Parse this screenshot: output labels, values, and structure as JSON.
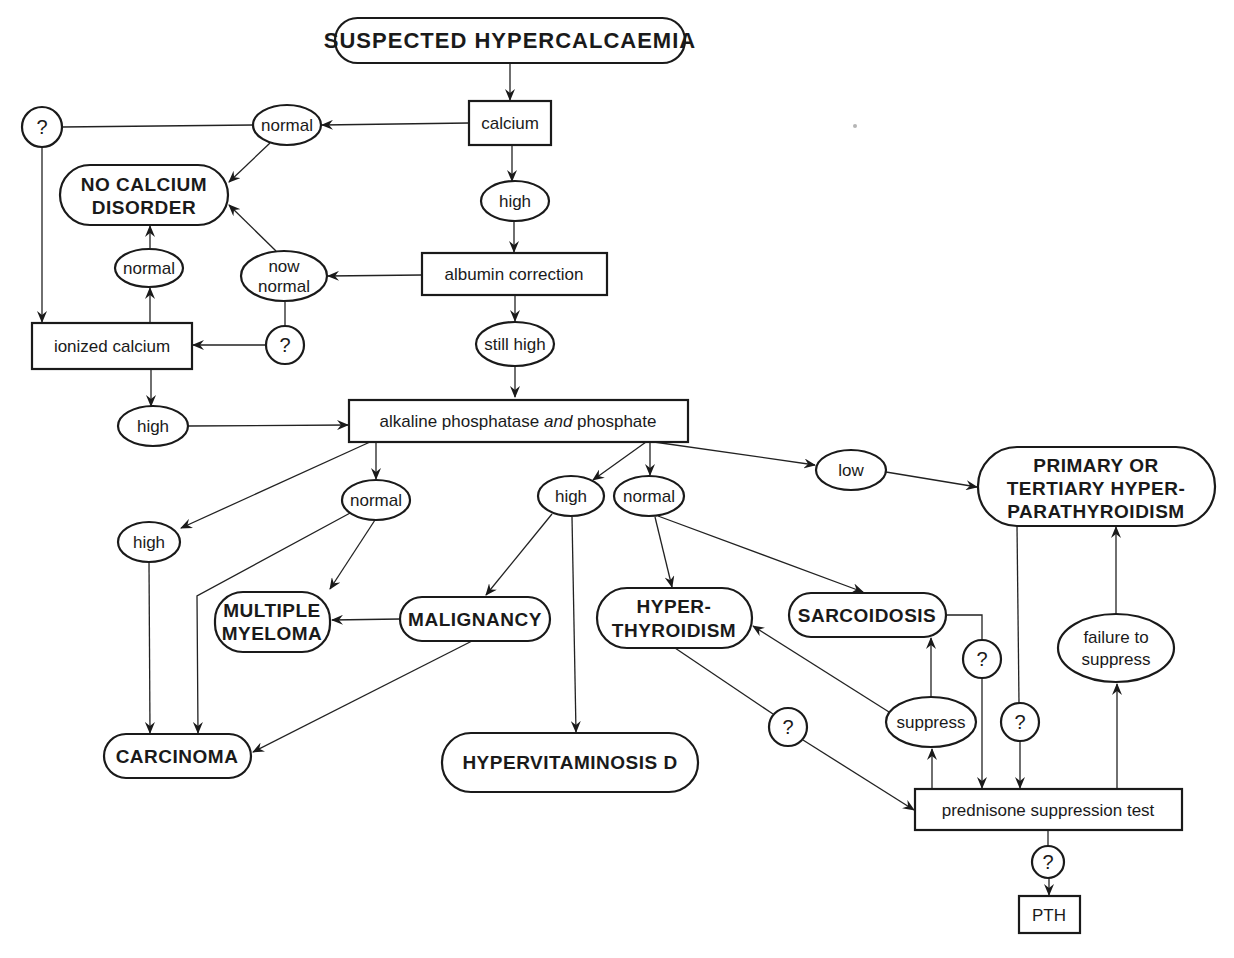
{
  "diagram": {
    "title": "SUSPECTED HYPERCALCAEMIA",
    "nodes": {
      "start": {
        "lines": [
          "SUSPECTED HYPERCALCAEMIA"
        ],
        "shape": "terminal"
      },
      "calcium": {
        "lines": [
          "calcium"
        ],
        "shape": "box"
      },
      "high_calcium": {
        "lines": [
          "high"
        ],
        "shape": "ellipse"
      },
      "normal_calcium": {
        "lines": [
          "normal"
        ],
        "shape": "ellipse"
      },
      "q_top_left": {
        "lines": [
          "?"
        ],
        "shape": "circle"
      },
      "no_calcium_disorder": {
        "lines": [
          "NO CALCIUM",
          "DISORDER"
        ],
        "shape": "terminal"
      },
      "albumin_correction": {
        "lines": [
          "albumin correction"
        ],
        "shape": "box"
      },
      "now_normal": {
        "lines": [
          "now",
          "normal"
        ],
        "shape": "ellipse"
      },
      "q_now_normal": {
        "lines": [
          "?"
        ],
        "shape": "circle"
      },
      "normal_ionized": {
        "lines": [
          "normal"
        ],
        "shape": "ellipse"
      },
      "ionized_calcium": {
        "lines": [
          "ionized calcium"
        ],
        "shape": "box"
      },
      "high_ionized": {
        "lines": [
          "high"
        ],
        "shape": "ellipse"
      },
      "still_high": {
        "lines": [
          "still high"
        ],
        "shape": "ellipse"
      },
      "alk_phos": {
        "lines": [
          "alkaline phosphatase ",
          "and",
          " phosphate"
        ],
        "shape": "box"
      },
      "high_alk_left": {
        "lines": [
          "high"
        ],
        "shape": "ellipse"
      },
      "normal_alk_left": {
        "lines": [
          "normal"
        ],
        "shape": "ellipse"
      },
      "high_phos_mid": {
        "lines": [
          "high"
        ],
        "shape": "ellipse"
      },
      "normal_phos_mid": {
        "lines": [
          "normal"
        ],
        "shape": "ellipse"
      },
      "low_phos": {
        "lines": [
          "low"
        ],
        "shape": "ellipse"
      },
      "primary_hpt": {
        "lines": [
          "PRIMARY OR",
          "TERTIARY HYPER-",
          "PARATHYROIDISM"
        ],
        "shape": "terminal"
      },
      "multiple_myeloma": {
        "lines": [
          "MULTIPLE",
          "MYELOMA"
        ],
        "shape": "terminal"
      },
      "malignancy": {
        "lines": [
          "MALIGNANCY"
        ],
        "shape": "terminal"
      },
      "hyperthyroidism": {
        "lines": [
          "HYPER-",
          "THYROIDISM"
        ],
        "shape": "terminal"
      },
      "sarcoidosis": {
        "lines": [
          "SARCOIDOSIS"
        ],
        "shape": "terminal"
      },
      "carcinoma": {
        "lines": [
          "CARCINOMA"
        ],
        "shape": "terminal"
      },
      "hypervitaminosis_d": {
        "lines": [
          "HYPERVITAMINOSIS D"
        ],
        "shape": "terminal"
      },
      "q_hyperthyroid": {
        "lines": [
          "?"
        ],
        "shape": "circle"
      },
      "suppress": {
        "lines": [
          "suppress"
        ],
        "shape": "ellipse"
      },
      "q_sarcoid": {
        "lines": [
          "?"
        ],
        "shape": "circle"
      },
      "q_primary": {
        "lines": [
          "?"
        ],
        "shape": "circle"
      },
      "failure_to_suppress": {
        "lines": [
          "failure to",
          "suppress"
        ],
        "shape": "ellipse"
      },
      "prednisone_test": {
        "lines": [
          "prednisone suppression test"
        ],
        "shape": "box"
      },
      "q_pth": {
        "lines": [
          "?"
        ],
        "shape": "circle"
      },
      "pth": {
        "lines": [
          "PTH"
        ],
        "shape": "box"
      }
    },
    "edges": [
      [
        "start",
        "calcium"
      ],
      [
        "calcium",
        "normal_calcium"
      ],
      [
        "calcium",
        "high_calcium"
      ],
      [
        "normal_calcium",
        "q_top_left"
      ],
      [
        "normal_calcium",
        "no_calcium_disorder"
      ],
      [
        "q_top_left",
        "ionized_calcium"
      ],
      [
        "high_calcium",
        "albumin_correction"
      ],
      [
        "albumin_correction",
        "now_normal"
      ],
      [
        "albumin_correction",
        "still_high"
      ],
      [
        "now_normal",
        "no_calcium_disorder"
      ],
      [
        "now_normal",
        "q_now_normal"
      ],
      [
        "q_now_normal",
        "ionized_calcium"
      ],
      [
        "ionized_calcium",
        "normal_ionized"
      ],
      [
        "normal_ionized",
        "no_calcium_disorder"
      ],
      [
        "ionized_calcium",
        "high_ionized"
      ],
      [
        "high_ionized",
        "alk_phos"
      ],
      [
        "still_high",
        "alk_phos"
      ],
      [
        "alk_phos",
        "high_alk_left"
      ],
      [
        "alk_phos",
        "normal_alk_left"
      ],
      [
        "alk_phos",
        "high_phos_mid"
      ],
      [
        "alk_phos",
        "normal_phos_mid"
      ],
      [
        "alk_phos",
        "low_phos"
      ],
      [
        "low_phos",
        "primary_hpt"
      ],
      [
        "high_alk_left",
        "carcinoma"
      ],
      [
        "normal_alk_left",
        "carcinoma"
      ],
      [
        "normal_alk_left",
        "multiple_myeloma"
      ],
      [
        "high_phos_mid",
        "malignancy"
      ],
      [
        "high_phos_mid",
        "hypervitaminosis_d"
      ],
      [
        "malignancy",
        "multiple_myeloma"
      ],
      [
        "malignancy",
        "carcinoma"
      ],
      [
        "normal_phos_mid",
        "hyperthyroidism"
      ],
      [
        "normal_phos_mid",
        "sarcoidosis"
      ],
      [
        "hyperthyroidism",
        "q_hyperthyroid"
      ],
      [
        "q_hyperthyroid",
        "prednisone_test"
      ],
      [
        "sarcoidosis",
        "q_sarcoid"
      ],
      [
        "q_sarcoid",
        "prednisone_test"
      ],
      [
        "primary_hpt",
        "q_primary"
      ],
      [
        "q_primary",
        "prednisone_test"
      ],
      [
        "prednisone_test",
        "suppress"
      ],
      [
        "suppress",
        "sarcoidosis"
      ],
      [
        "suppress",
        "hyperthyroidism"
      ],
      [
        "prednisone_test",
        "failure_to_suppress"
      ],
      [
        "failure_to_suppress",
        "primary_hpt"
      ],
      [
        "prednisone_test",
        "q_pth"
      ],
      [
        "q_pth",
        "pth"
      ]
    ]
  }
}
